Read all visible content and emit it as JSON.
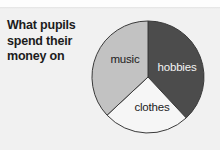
{
  "figure": {
    "title_lines": [
      "What pupils",
      "spend their",
      "money on"
    ],
    "background_color": "#f1f1f1"
  },
  "chart_data": {
    "type": "pie",
    "title": "What pupils spend their money on",
    "xlabel": "",
    "ylabel": "",
    "grid": false,
    "legend": "none (slices labelled in place)",
    "start_angle_deg": 0,
    "direction": "clockwise",
    "categories": [
      "hobbies",
      "clothes",
      "music"
    ],
    "values": [
      38,
      25,
      37
    ],
    "units": "percent",
    "slices": [
      {
        "label": "hobbies",
        "value": 38,
        "start_angle_deg": 0,
        "end_angle_deg": 137,
        "color": "#4c4c4c",
        "label_color": "#f4f4f4",
        "label_x": 89,
        "label_y": 55
      },
      {
        "label": "clothes",
        "value": 25,
        "start_angle_deg": 137,
        "end_angle_deg": 227,
        "color": "#f6f6f6",
        "label_color": "#1c1c1c",
        "label_x": 64,
        "label_y": 95
      },
      {
        "label": "music",
        "value": 37,
        "start_angle_deg": 227,
        "end_angle_deg": 360,
        "color": "#c2c2c2",
        "label_color": "#1c1c1c",
        "label_x": 37,
        "label_y": 47
      }
    ],
    "geometry": {
      "center_x": 60,
      "center_y": 61,
      "radius": 56,
      "outline_color": "#3a3a3a"
    }
  }
}
